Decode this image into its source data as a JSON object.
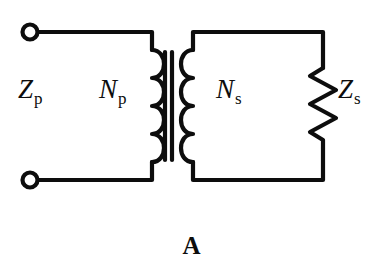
{
  "figure": {
    "kind": "transformer-circuit-diagram",
    "caption": "A",
    "background_color": "#ffffff",
    "line_color": "#0d0d0d"
  },
  "labels": {
    "primary_impedance": {
      "symbol": "Z",
      "subscript": "p",
      "text": "Zp"
    },
    "primary_turns": {
      "symbol": "N",
      "subscript": "p",
      "text": "Np"
    },
    "secondary_turns": {
      "symbol": "N",
      "subscript": "s",
      "text": "Ns"
    },
    "secondary_impedance": {
      "symbol": "Z",
      "subscript": "s",
      "text": "Zs"
    }
  },
  "components": {
    "terminal_top": {
      "name": "open-circle-terminal",
      "shape": "circle-outline"
    },
    "terminal_bottom": {
      "name": "open-circle-terminal",
      "shape": "circle-outline"
    },
    "primary_coil": {
      "name": "inductor-coil",
      "bumps": 4,
      "opens": "right"
    },
    "secondary_coil": {
      "name": "inductor-coil",
      "bumps": 4,
      "opens": "left"
    },
    "core": {
      "name": "transformer-core",
      "lines": 2,
      "orientation": "vertical"
    },
    "load_resistor": {
      "name": "resistor-zigzag",
      "zigzags": 6,
      "orientation": "vertical"
    }
  }
}
